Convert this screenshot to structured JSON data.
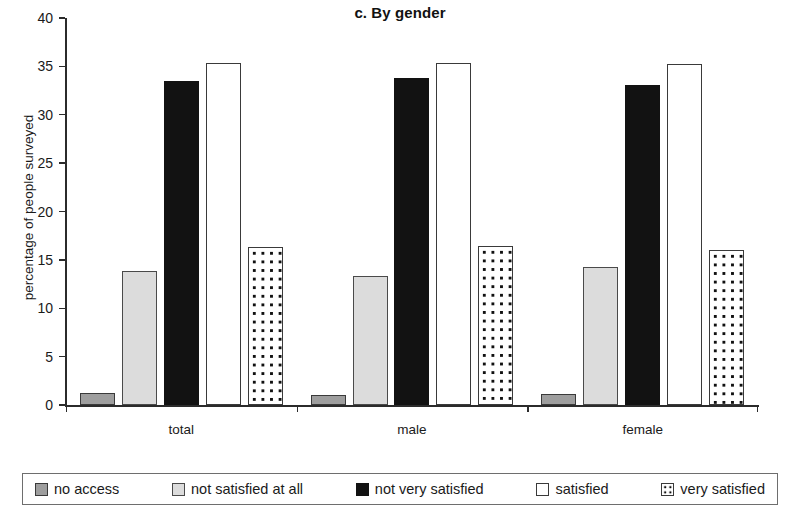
{
  "chart_data": {
    "type": "bar",
    "title": "c. By gender",
    "xlabel": "",
    "ylabel": "percentage of people surveyed",
    "categories": [
      "total",
      "male",
      "female"
    ],
    "ylim": [
      0,
      40
    ],
    "yticks": [
      0,
      5,
      10,
      15,
      20,
      25,
      30,
      35,
      40
    ],
    "ytick_labels": [
      "0",
      "5",
      "10",
      "15",
      "20",
      "25",
      "30",
      "35",
      "40"
    ],
    "grid": false,
    "legend_position": "bottom",
    "series": [
      {
        "name": "no access",
        "pattern": "solid-gray",
        "color": "#9e9e9e",
        "values": [
          1.2,
          1.0,
          1.1
        ]
      },
      {
        "name": "not satisfied at all",
        "pattern": "solid-light-gray",
        "color": "#dcdcdc",
        "values": [
          13.9,
          13.3,
          14.3
        ]
      },
      {
        "name": "not very satisfied",
        "pattern": "solid-black",
        "color": "#121212",
        "values": [
          33.5,
          33.8,
          33.1
        ]
      },
      {
        "name": "satisfied",
        "pattern": "solid-white",
        "color": "#ffffff",
        "values": [
          35.3,
          35.3,
          35.2
        ]
      },
      {
        "name": "very satisfied",
        "pattern": "dotted",
        "color": "#ffffff",
        "values": [
          16.3,
          16.4,
          16.0
        ]
      }
    ]
  },
  "legend": {
    "items": [
      {
        "label": "no access",
        "swatch": "swatch-no-access"
      },
      {
        "label": "not satisfied at all",
        "swatch": "swatch-not-satisfied-at-all"
      },
      {
        "label": "not very satisfied",
        "swatch": "swatch-not-very-satisfied"
      },
      {
        "label": "satisfied",
        "swatch": "swatch-satisfied"
      },
      {
        "label": "very satisfied",
        "swatch": "swatch-very-satisfied"
      }
    ]
  }
}
